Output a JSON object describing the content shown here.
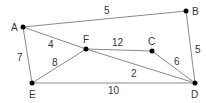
{
  "graph": {
    "nodes": [
      {
        "id": "A",
        "label": "A",
        "x": 23,
        "y": 27,
        "lx": 11,
        "ly": 31
      },
      {
        "id": "B",
        "label": "B",
        "x": 186,
        "y": 11,
        "lx": 192,
        "ly": 15
      },
      {
        "id": "C",
        "label": "C",
        "x": 152,
        "y": 51,
        "lx": 148,
        "ly": 45
      },
      {
        "id": "D",
        "label": "D",
        "x": 195,
        "y": 83,
        "lx": 191,
        "ly": 98
      },
      {
        "id": "E",
        "label": "E",
        "x": 32,
        "y": 83,
        "lx": 29,
        "ly": 98
      },
      {
        "id": "F",
        "label": "F",
        "x": 86,
        "y": 49,
        "lx": 83,
        "ly": 43
      }
    ],
    "edges": [
      {
        "from": "A",
        "to": "B",
        "weight": "5",
        "lx": 104,
        "ly": 14
      },
      {
        "from": "A",
        "to": "F",
        "weight": "4",
        "lx": 48,
        "ly": 48
      },
      {
        "from": "A",
        "to": "E",
        "weight": "7",
        "lx": 17,
        "ly": 61
      },
      {
        "from": "F",
        "to": "E",
        "weight": "8",
        "lx": 52,
        "ly": 66
      },
      {
        "from": "F",
        "to": "C",
        "weight": "12",
        "lx": 112,
        "ly": 46
      },
      {
        "from": "F",
        "to": "D",
        "weight": "2",
        "lx": 131,
        "ly": 77
      },
      {
        "from": "C",
        "to": "D",
        "weight": "6",
        "lx": 174,
        "ly": 65
      },
      {
        "from": "B",
        "to": "D",
        "weight": "5",
        "lx": 195,
        "ly": 53
      },
      {
        "from": "E",
        "to": "D",
        "weight": "10",
        "lx": 108,
        "ly": 94
      }
    ]
  }
}
